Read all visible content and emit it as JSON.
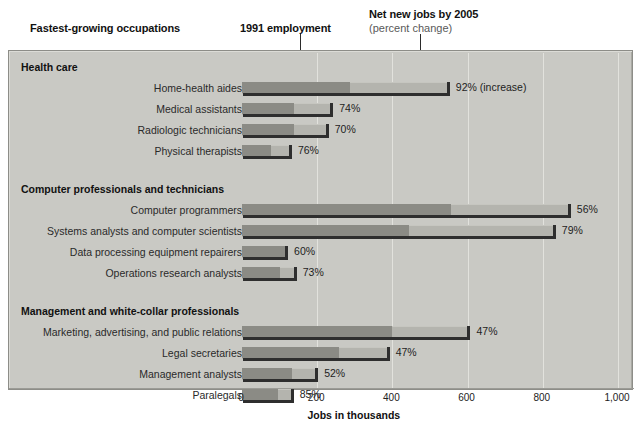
{
  "header": {
    "fastest_title": "Fastest-growing occupations",
    "employment_title": "1991 employment",
    "netjobs_title": "Net new jobs by 2005",
    "netjobs_sub": "(percent change)"
  },
  "axis": {
    "title": "Jobs in thousands",
    "ticks": [
      "0",
      "200",
      "400",
      "600",
      "800",
      "1,000"
    ],
    "tick_values": [
      0,
      200,
      400,
      600,
      800,
      1000
    ]
  },
  "colors": {
    "panel": "#c9c9c4",
    "bar_dark": "#8b8b85",
    "bar_light": "#b4b4ae",
    "bar_outline": "#2e2e2e",
    "gridline": "#e2e2dd"
  },
  "chart_data": {
    "type": "bar",
    "title": "Fastest-growing occupations",
    "subtitle": "1991 employment and Net new jobs by 2005 (percent change)",
    "xlabel": "Jobs in thousands",
    "ylabel": "",
    "xlim": [
      0,
      1000
    ],
    "grid": true,
    "legend_position": "top-callouts",
    "series": [
      {
        "name": "1991 employment",
        "color": "#8b8b85"
      },
      {
        "name": "Net new jobs by 2005",
        "color": "#b4b4ae"
      }
    ],
    "groups": [
      {
        "name": "Health care",
        "rows": [
          {
            "label": "Home-health aides",
            "employment_1991": 287,
            "total_2005": 550,
            "percent_change": "92%",
            "value_label": "92% (increase)"
          },
          {
            "label": "Medical assistants",
            "employment_1991": 138,
            "total_2005": 240,
            "percent_change": "74%",
            "value_label": "74%"
          },
          {
            "label": "Radiologic technicians",
            "employment_1991": 138,
            "total_2005": 228,
            "percent_change": "70%",
            "value_label": "70%"
          },
          {
            "label": "Physical therapists",
            "employment_1991": 76,
            "total_2005": 130,
            "percent_change": "76%",
            "value_label": "76%"
          }
        ]
      },
      {
        "name": "Computer professionals and technicians",
        "rows": [
          {
            "label": "Computer programmers",
            "employment_1991": 555,
            "total_2005": 872,
            "percent_change": "56%",
            "value_label": "56%"
          },
          {
            "label": "Systems analysts and computer scientists",
            "employment_1991": 445,
            "total_2005": 832,
            "percent_change": "79%",
            "value_label": "79%"
          },
          {
            "label": "Data processing equipment repairers",
            "employment_1991": 115,
            "total_2005": 120,
            "percent_change": "60%",
            "value_label": "60%"
          },
          {
            "label": "Operations research analysts",
            "employment_1991": 100,
            "total_2005": 143,
            "percent_change": "73%",
            "value_label": "73%"
          }
        ]
      },
      {
        "name": "Management and white-collar professionals",
        "rows": [
          {
            "label": "Marketing, advertising, and public relations",
            "employment_1991": 400,
            "total_2005": 605,
            "percent_change": "47%",
            "value_label": "47%"
          },
          {
            "label": "Legal secretaries",
            "employment_1991": 258,
            "total_2005": 390,
            "percent_change": "47%",
            "value_label": "47%"
          },
          {
            "label": "Management analysts",
            "employment_1991": 132,
            "total_2005": 200,
            "percent_change": "52%",
            "value_label": "52%"
          },
          {
            "label": "Paralegals",
            "employment_1991": 95,
            "total_2005": 135,
            "percent_change": "85%",
            "value_label": "85%"
          }
        ]
      }
    ]
  }
}
